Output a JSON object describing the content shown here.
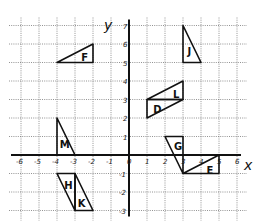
{
  "diagram": {
    "type": "coordinate-grid",
    "axes": {
      "x_label": "x",
      "y_label": "y",
      "x_range": [
        -6,
        6
      ],
      "y_range": [
        -3,
        7
      ],
      "x_ticks": [
        "-6",
        "-5",
        "-4",
        "-3",
        "-2",
        "-1",
        "0",
        "1",
        "2",
        "3",
        "4",
        "5",
        "6"
      ],
      "y_ticks": [
        "-3",
        "-2",
        "-1",
        "1",
        "2",
        "3",
        "4",
        "5",
        "6",
        "7"
      ]
    },
    "shapes": [
      {
        "label": "F",
        "points": [
          [
            -4,
            5
          ],
          [
            -2,
            6
          ],
          [
            -2,
            5
          ]
        ],
        "label_at": [
          -2.65,
          5.3
        ]
      },
      {
        "label": "J",
        "points": [
          [
            3,
            7
          ],
          [
            3,
            5
          ],
          [
            4,
            5
          ]
        ],
        "label_at": [
          3.25,
          5.6
        ]
      },
      {
        "label": "L",
        "points": [
          [
            1,
            3
          ],
          [
            3,
            4
          ],
          [
            3,
            3
          ]
        ],
        "label_at": [
          2.45,
          3.3
        ]
      },
      {
        "label": "D",
        "points": [
          [
            1,
            3
          ],
          [
            1,
            2
          ],
          [
            3,
            3
          ]
        ],
        "label_at": [
          1.35,
          2.5
        ]
      },
      {
        "label": "M",
        "points": [
          [
            -4,
            2
          ],
          [
            -4,
            0
          ],
          [
            -3,
            0
          ]
        ],
        "label_at": [
          -3.85,
          0.6
        ]
      },
      {
        "label": "H",
        "points": [
          [
            -4,
            -1
          ],
          [
            -3,
            -1
          ],
          [
            -3,
            -3
          ]
        ],
        "label_at": [
          -3.6,
          -1.6
        ]
      },
      {
        "label": "K",
        "points": [
          [
            -3,
            -1
          ],
          [
            -3,
            -3
          ],
          [
            -2,
            -3
          ]
        ],
        "label_at": [
          -2.85,
          -2.6
        ]
      },
      {
        "label": "G",
        "points": [
          [
            2,
            1
          ],
          [
            3,
            1
          ],
          [
            3,
            -1
          ]
        ],
        "label_at": [
          2.5,
          0.5
        ]
      },
      {
        "label": "E",
        "points": [
          [
            3,
            -1
          ],
          [
            5,
            0
          ],
          [
            5,
            -1
          ]
        ],
        "label_at": [
          4.3,
          -0.8
        ]
      }
    ]
  },
  "layout": {
    "origin_px": [
      129,
      155
    ],
    "unit_x_px": 18,
    "unit_y_px": 18.5
  }
}
